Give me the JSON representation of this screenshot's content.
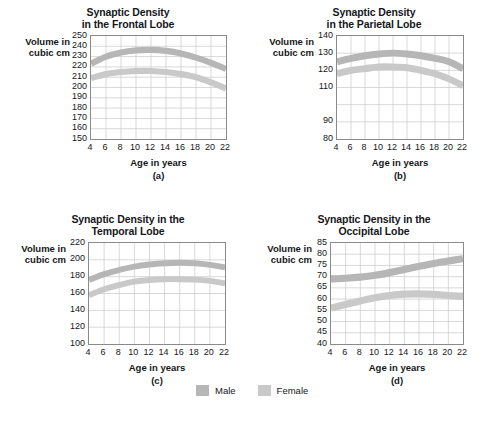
{
  "figure": {
    "axis_title_y": "Volume in\ncubic cm",
    "axis_title_y_line1": "Volume in",
    "axis_title_y_line2": "cubic cm",
    "axis_title_x": "Age in years"
  },
  "legend": {
    "position": "bottom-center",
    "items": [
      {
        "label": "Male",
        "color": "#b6b6b6"
      },
      {
        "label": "Female",
        "color": "#c9c9c9"
      }
    ]
  },
  "panels": [
    {
      "letter": "(a)",
      "title_line1": "Synaptic Density",
      "title_line2": "in the Frontal Lobe"
    },
    {
      "letter": "(b)",
      "title_line1": "Synaptic Density",
      "title_line2": "in the Parietal Lobe"
    },
    {
      "letter": "(c)",
      "title_line1": "Synaptic Density in the",
      "title_line2": "Temporal Lobe"
    },
    {
      "letter": "(d)",
      "title_line1": "Synaptic Density in the",
      "title_line2": "Occipital Lobe"
    }
  ],
  "chart_data": [
    {
      "type": "area",
      "panel": "(a)",
      "title": "Synaptic Density in the Frontal Lobe",
      "xlabel": "Age in years",
      "ylabel": "Volume in cubic cm",
      "xlim": [
        4,
        22
      ],
      "ylim": [
        150,
        250
      ],
      "xticks": [
        4,
        6,
        8,
        10,
        12,
        14,
        16,
        18,
        20,
        22
      ],
      "yticks": [
        150,
        160,
        170,
        180,
        190,
        200,
        210,
        220,
        230,
        240,
        250
      ],
      "grid": true,
      "x": [
        4,
        6,
        8,
        10,
        12,
        14,
        16,
        18,
        20,
        22
      ],
      "series": [
        {
          "name": "Male",
          "color": "#b6b6b6",
          "band_halfwidth": 3,
          "values": [
            223,
            230,
            234,
            236,
            236.5,
            235.5,
            233,
            229,
            224,
            218
          ]
        },
        {
          "name": "Female",
          "color": "#c9c9c9",
          "band_halfwidth": 3,
          "values": [
            209,
            213,
            215,
            216,
            216,
            215,
            213,
            210,
            205,
            199
          ]
        }
      ]
    },
    {
      "type": "area",
      "panel": "(b)",
      "title": "Synaptic Density in the Parietal Lobe",
      "xlabel": "Age in years",
      "ylabel": "Volume in cubic cm",
      "xlim": [
        4,
        22
      ],
      "ylim": [
        80,
        140
      ],
      "xticks": [
        4,
        6,
        8,
        10,
        12,
        14,
        16,
        18,
        20,
        22
      ],
      "yticks": [
        80,
        90,
        110,
        120,
        130,
        140
      ],
      "ytick_positions": [
        80,
        90,
        100,
        110,
        120,
        130,
        140
      ],
      "grid": true,
      "x": [
        4,
        6,
        8,
        10,
        12,
        14,
        16,
        18,
        20,
        22
      ],
      "series": [
        {
          "name": "Male",
          "color": "#b6b6b6",
          "band_halfwidth": 2,
          "values": [
            125,
            127,
            128.5,
            129.5,
            130,
            129.5,
            128.5,
            127,
            125,
            121
          ]
        },
        {
          "name": "Female",
          "color": "#c9c9c9",
          "band_halfwidth": 2,
          "values": [
            118,
            120,
            121,
            122,
            122,
            121.5,
            120,
            118,
            115,
            111
          ]
        }
      ]
    },
    {
      "type": "area",
      "panel": "(c)",
      "title": "Synaptic Density in the Temporal Lobe",
      "xlabel": "Age in years",
      "ylabel": "Volume in cubic cm",
      "xlim": [
        4,
        22
      ],
      "ylim": [
        100,
        220
      ],
      "xticks": [
        4,
        6,
        8,
        10,
        12,
        14,
        16,
        18,
        20,
        22
      ],
      "yticks": [
        100,
        120,
        140,
        160,
        180,
        200,
        220
      ],
      "grid": true,
      "x": [
        4,
        6,
        8,
        10,
        12,
        14,
        16,
        18,
        20,
        22
      ],
      "series": [
        {
          "name": "Male",
          "color": "#b6b6b6",
          "band_halfwidth": 3.5,
          "values": [
            176,
            183,
            188,
            192,
            194.5,
            196,
            196.5,
            196,
            194,
            191
          ]
        },
        {
          "name": "Female",
          "color": "#c9c9c9",
          "band_halfwidth": 3.5,
          "values": [
            158,
            165,
            170,
            174,
            176,
            177,
            177,
            176.5,
            175,
            172
          ]
        }
      ]
    },
    {
      "type": "area",
      "panel": "(d)",
      "title": "Synaptic Density in the Occipital Lobe",
      "xlabel": "Age in years",
      "ylabel": "Volume in cubic cm",
      "xlim": [
        4,
        22
      ],
      "ylim": [
        40,
        85
      ],
      "xticks": [
        4,
        6,
        8,
        10,
        12,
        14,
        16,
        18,
        20,
        22
      ],
      "yticks": [
        40,
        45,
        50,
        55,
        60,
        65,
        70,
        75,
        80,
        85
      ],
      "grid": true,
      "x": [
        4,
        6,
        8,
        10,
        12,
        14,
        16,
        18,
        20,
        22
      ],
      "series": [
        {
          "name": "Male",
          "color": "#b6b6b6",
          "band_halfwidth": 1.6,
          "values": [
            69,
            69.3,
            69.8,
            70.6,
            71.8,
            73.2,
            74.6,
            75.9,
            77,
            78
          ]
        },
        {
          "name": "Female",
          "color": "#c9c9c9",
          "band_halfwidth": 1.6,
          "values": [
            56,
            57.6,
            59.2,
            60.6,
            61.6,
            62.2,
            62.3,
            62.1,
            61.6,
            61.2
          ]
        }
      ]
    }
  ]
}
